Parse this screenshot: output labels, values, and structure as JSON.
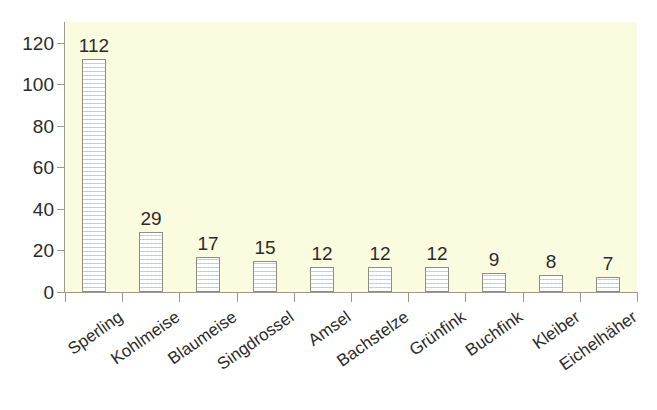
{
  "chart_data": {
    "type": "bar",
    "title": "",
    "subtitle": "",
    "xlabel": "",
    "ylabel": "",
    "categories": [
      "Sperling",
      "Kohlmeise",
      "Blaumeise",
      "Singdrossel",
      "Amsel",
      "Bachstelze",
      "Grünfink",
      "Buchfink",
      "Kleiber",
      "Eichelhäher"
    ],
    "values": [
      112,
      29,
      17,
      15,
      12,
      12,
      12,
      9,
      8,
      7
    ],
    "data_labels": [
      "112",
      "29",
      "17",
      "15",
      "12",
      "12",
      "12",
      "9",
      "8",
      "7"
    ],
    "ylim": [
      0,
      130
    ],
    "y_ticks": [
      0,
      20,
      40,
      60,
      80,
      100,
      120
    ],
    "y_tick_labels": [
      "0",
      "20",
      "40",
      "60",
      "80",
      "100",
      "120"
    ],
    "grid": false,
    "legend": false,
    "legend_position": "none",
    "bar_fill_color": "#e9ecef",
    "bar_border_color": "#8e8e82",
    "plot_background_color": "#fbfbdf",
    "page_background_color": "#ffffff",
    "axis_color": "#9a9a8d",
    "text_color": "#2b2b2b",
    "category_label_rotation_degrees": -35
  }
}
